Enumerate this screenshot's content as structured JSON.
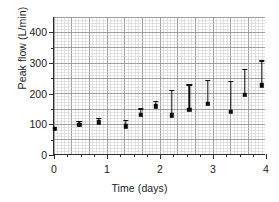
{
  "chart_data": {
    "type": "scatter",
    "title": "",
    "xlabel": "Time (days)",
    "ylabel": "Peak flow (L/min)",
    "xlim": [
      0,
      4
    ],
    "ylim": [
      0,
      450
    ],
    "xticks": [
      0,
      1,
      2,
      3,
      4
    ],
    "xtick_labels": [
      "0",
      "1",
      "2",
      "3",
      "4"
    ],
    "yticks": [
      0,
      100,
      200,
      300,
      400
    ],
    "ytick_labels": [
      "0",
      "100",
      "200",
      "300",
      "400"
    ],
    "grid": true,
    "grid_style": "fine rectangular graph-paper grid, minor and major lines",
    "legend": "none",
    "marker": "filled square",
    "error_bars": "vertical with caps",
    "series": [
      {
        "name": "Peak flow",
        "points": [
          {
            "x": 0.02,
            "y": 85,
            "low": 85,
            "high": 85
          },
          {
            "x": 0.48,
            "y": 98,
            "low": 92,
            "high": 112
          },
          {
            "x": 0.85,
            "y": 107,
            "low": 103,
            "high": 120
          },
          {
            "x": 1.35,
            "y": 94,
            "low": 90,
            "high": 115
          },
          {
            "x": 1.64,
            "y": 131,
            "low": 127,
            "high": 152
          },
          {
            "x": 1.92,
            "y": 159,
            "low": 155,
            "high": 176
          },
          {
            "x": 2.22,
            "y": 130,
            "low": 127,
            "high": 212
          },
          {
            "x": 2.55,
            "y": 148,
            "low": 145,
            "high": 230
          },
          {
            "x": 2.9,
            "y": 167,
            "low": 163,
            "high": 245
          },
          {
            "x": 3.34,
            "y": 140,
            "low": 136,
            "high": 241
          },
          {
            "x": 3.6,
            "y": 197,
            "low": 193,
            "high": 280
          },
          {
            "x": 3.92,
            "y": 227,
            "low": 223,
            "high": 309
          }
        ]
      }
    ]
  },
  "axes": {
    "y_title": "Peak flow (L/min)",
    "x_title": "Time (days)"
  },
  "colors": {
    "marker": "#0b0b0b",
    "errorbar": "#111111",
    "axis": "#2c2c2c",
    "grid_minor": "#c9c9c9",
    "grid_major": "#8f8f8f",
    "background": "#ffffff",
    "text": "#1b1b1b"
  }
}
